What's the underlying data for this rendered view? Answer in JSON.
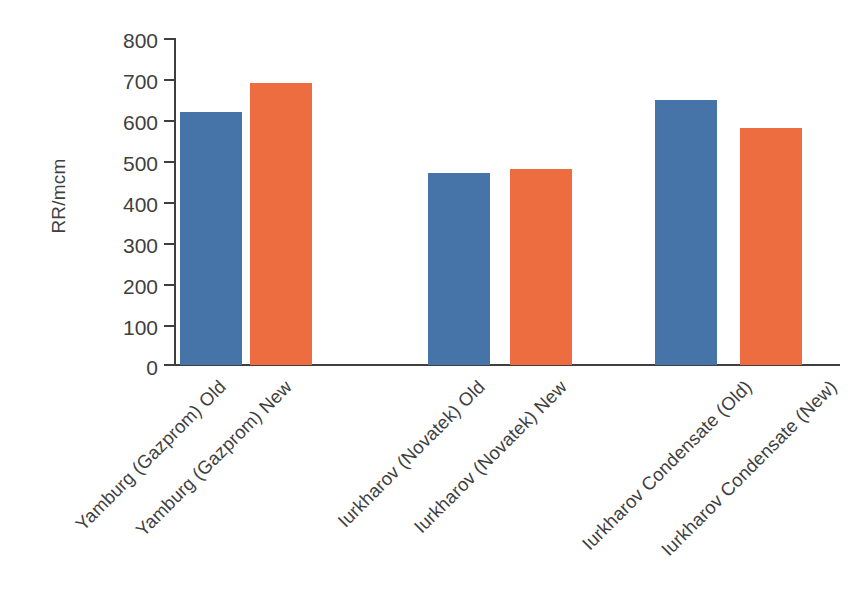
{
  "chart_data": {
    "type": "bar",
    "title": "",
    "subtitle": "",
    "xlabel": "",
    "ylabel": "RR/mcm",
    "ylim": [
      0,
      800
    ],
    "ytick_step": 100,
    "yticks": [
      "800",
      "700",
      "600",
      "500",
      "400",
      "300",
      "200",
      "100",
      "0"
    ],
    "grid": false,
    "legend": "none",
    "categories": [
      "Yamburg (Gazprom) Old",
      "Yamburg (Gazprom) New",
      "Iurkharov (Novatek) Old",
      "Iurkharov (Novatek) New",
      "Iurkharov Condensate (Old)",
      "Iurkharov Condensate (New)"
    ],
    "values": [
      620,
      690,
      470,
      480,
      648,
      580
    ],
    "bar_series": [
      "old",
      "new",
      "old",
      "new",
      "old",
      "new"
    ],
    "groups": [
      {
        "name": "Yamburg (Gazprom)",
        "old": 620,
        "new": 690
      },
      {
        "name": "Iurkharov (Novatek)",
        "old": 470,
        "new": 480
      },
      {
        "name": "Iurkharov Condensate",
        "old": 648,
        "new": 580
      }
    ],
    "colors": {
      "old_series": "#4673a8",
      "new_series": "#ed6d40",
      "axis": "#3f3f3f",
      "text": "#3f3f3f",
      "background": "#ffffff"
    }
  }
}
